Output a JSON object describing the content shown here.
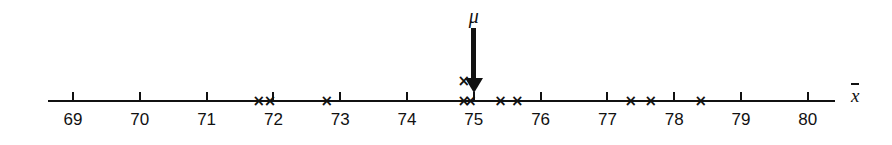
{
  "figure": {
    "background_color": "#ffffff",
    "ink_color": "#111111"
  },
  "chart_data": {
    "type": "scatter",
    "title": "",
    "subtitle": "",
    "xlabel": "x̄",
    "ylabel": "",
    "xlim": [
      68.6,
      80.4
    ],
    "grid": false,
    "legend": null,
    "tick_labels": [
      "69",
      "70",
      "71",
      "72",
      "73",
      "74",
      "75",
      "76",
      "77",
      "78",
      "79",
      "80"
    ],
    "ticks": [
      69,
      70,
      71,
      72,
      73,
      74,
      75,
      76,
      77,
      78,
      79,
      80
    ],
    "marker": "x",
    "x": [
      71.78,
      71.95,
      72.8,
      74.85,
      74.85,
      74.95,
      75.4,
      75.65,
      77.35,
      77.65,
      78.4
    ],
    "stack_level": [
      0,
      0,
      0,
      0,
      1,
      0,
      0,
      0,
      0,
      0,
      0
    ],
    "point_count": 11,
    "annotations": [
      {
        "name": "mu-pointer",
        "label": "μ",
        "x": 75,
        "kind": "down-arrow"
      }
    ]
  }
}
